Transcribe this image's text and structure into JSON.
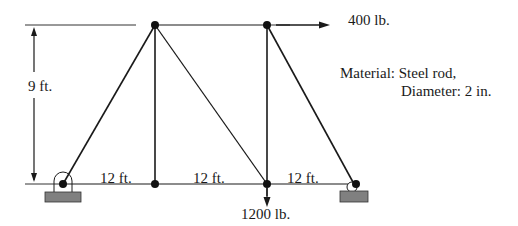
{
  "diagram": {
    "type": "truss",
    "loads": {
      "horizontal": "400 lb.",
      "vertical": "1200 lb."
    },
    "dimensions": {
      "height": "9 ft.",
      "spans": [
        "12 ft.",
        "12 ft.",
        "12 ft."
      ]
    },
    "material": {
      "line1": "Material: Steel rod,",
      "line2": "Diameter: 2 in."
    },
    "colors": {
      "member": "#1a1a1a",
      "support": "#808080"
    }
  }
}
